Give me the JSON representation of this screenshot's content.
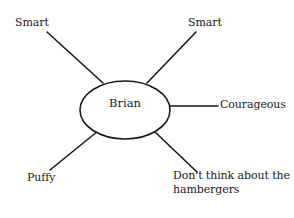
{
  "diagram": {
    "type": "mind-map",
    "center": {
      "label": "Brian",
      "shape": "ellipse"
    },
    "branches": [
      {
        "id": "top-left",
        "label": "Smart"
      },
      {
        "id": "top-right",
        "label": "Smart"
      },
      {
        "id": "right",
        "label": "Courageous"
      },
      {
        "id": "bottom-left",
        "label": "Puffy"
      },
      {
        "id": "bottom-right",
        "label_line1": "Don't think about the",
        "label_line2": "hambergers"
      }
    ],
    "colors": {
      "stroke": "#1a1a1a",
      "background": "#ffffff",
      "text": "#1a1a1a"
    }
  }
}
